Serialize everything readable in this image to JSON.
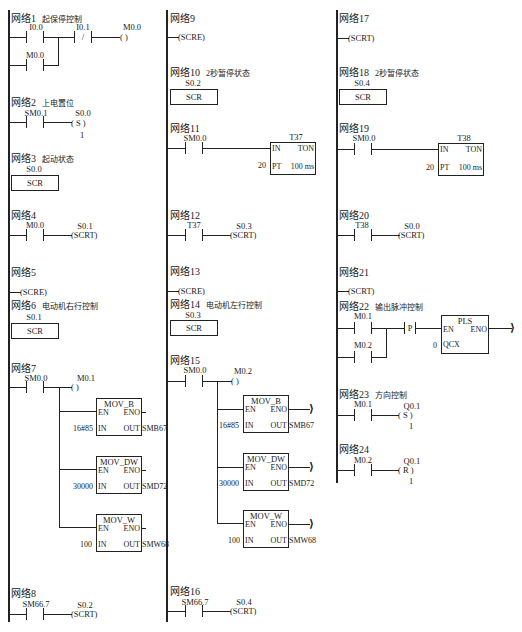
{
  "diagram": {
    "type": "PLC ladder diagram (Siemens S7-200)",
    "columns": 3
  },
  "networks": {
    "n1": {
      "label": "网络1",
      "desc": "起保停控制",
      "contacts": [
        "I0.0",
        "I0.1",
        "M0.0"
      ],
      "coil": "M0.0",
      "nc_symbol": "/",
      "coil_symbol": "(      )"
    },
    "n2": {
      "label": "网络2",
      "desc": "上电置位",
      "contact": "SM0.1",
      "coil": "S0.0",
      "coil_symbol": "( S )",
      "count": "1"
    },
    "n3": {
      "label": "网络3",
      "desc": "起动状态",
      "scr_bit": "S0.0",
      "scr": "SCR"
    },
    "n4": {
      "label": "网络4",
      "contact": "M0.0",
      "coil": "S0.1",
      "coil_symbol": "(SCRT)"
    },
    "n5": {
      "label": "网络5",
      "coil_symbol": "(SCRE)"
    },
    "n6": {
      "label": "网络6",
      "desc": "电动机右行控制",
      "scr_bit": "S0.1",
      "scr": "SCR"
    },
    "n7": {
      "label": "网络7",
      "contact": "SM0.0",
      "coil": "M0.1",
      "coil_symbol": "(      )",
      "boxes": [
        {
          "name": "MOV_B",
          "en": "EN",
          "eno": "ENO",
          "in_pin": "IN",
          "out_pin": "OUT",
          "in": "16#85",
          "out": "SMB67"
        },
        {
          "name": "MOV_DW",
          "en": "EN",
          "eno": "ENO",
          "in_pin": "IN",
          "out_pin": "OUT",
          "in": "30000",
          "out": "SMD72"
        },
        {
          "name": "MOV_W",
          "en": "EN",
          "eno": "ENO",
          "in_pin": "IN",
          "out_pin": "OUT",
          "in": "100",
          "out": "SMW68"
        }
      ]
    },
    "n8": {
      "label": "网络8",
      "contact": "SM66.7",
      "coil": "S0.2",
      "coil_symbol": "(SCRT)"
    },
    "n9": {
      "label": "网络9",
      "coil_symbol": "(SCRE)"
    },
    "n10": {
      "label": "网络10",
      "desc": "2秒暂停状态",
      "scr_bit": "S0.2",
      "scr": "SCR"
    },
    "n11": {
      "label": "网络11",
      "contact": "SM0.0",
      "timer": "T37",
      "type": "TON",
      "in_pin": "IN",
      "pt_pin": "PT",
      "pt": "20",
      "res": "100 ms"
    },
    "n12": {
      "label": "网络12",
      "contact": "T37",
      "coil": "S0.3",
      "coil_symbol": "(SCRT)"
    },
    "n13": {
      "label": "网络13",
      "coil_symbol": "(SCRE)"
    },
    "n14": {
      "label": "网络14",
      "desc": "电动机左行控制",
      "scr_bit": "S0.3",
      "scr": "SCR"
    },
    "n15": {
      "label": "网络15",
      "contact": "SM0.0",
      "coil": "M0.2",
      "coil_symbol": "(      )",
      "boxes": [
        {
          "name": "MOV_B",
          "en": "EN",
          "eno": "ENO",
          "in_pin": "IN",
          "out_pin": "OUT",
          "in": "16#85",
          "out": "SMB67"
        },
        {
          "name": "MOV_DW",
          "en": "EN",
          "eno": "ENO",
          "in_pin": "IN",
          "out_pin": "OUT",
          "in": "30000",
          "out": "SMD72"
        },
        {
          "name": "MOV_W",
          "en": "EN",
          "eno": "ENO",
          "in_pin": "IN",
          "out_pin": "OUT",
          "in": "100",
          "out": "SMW68"
        }
      ]
    },
    "n16": {
      "label": "网络16",
      "contact": "SM66.7",
      "coil": "S0.4",
      "coil_symbol": "(SCRT)"
    },
    "n17": {
      "label": "网络17",
      "coil_symbol": "(SCRT)"
    },
    "n18": {
      "label": "网络18",
      "desc": "2秒暂停状态",
      "scr_bit": "S0.4",
      "scr": "SCR"
    },
    "n19": {
      "label": "网络19",
      "contact": "SM0.0",
      "timer": "T38",
      "type": "TON",
      "in_pin": "IN",
      "pt_pin": "PT",
      "pt": "20",
      "res": "100 ms"
    },
    "n20": {
      "label": "网络20",
      "contact": "T38",
      "coil": "S0.0",
      "coil_symbol": "(SCRT)"
    },
    "n21": {
      "label": "网络21",
      "coil_symbol": "(SCRT)"
    },
    "n22": {
      "label": "网络22",
      "desc": "输出脉冲控制",
      "contacts": [
        "M0.1",
        "M0.2"
      ],
      "edge": "P",
      "box": "PLS",
      "en": "EN",
      "eno": "ENO",
      "q_pin": "QCX",
      "q": "0"
    },
    "n23": {
      "label": "网络23",
      "desc": "方向控制",
      "contact": "M0.1",
      "coil": "Q0.1",
      "coil_symbol": "( S )",
      "count": "1"
    },
    "n24": {
      "label": "网络24",
      "contact": "M0.2",
      "coil": "Q0.1",
      "coil_symbol": "( R )",
      "count": "1"
    }
  }
}
